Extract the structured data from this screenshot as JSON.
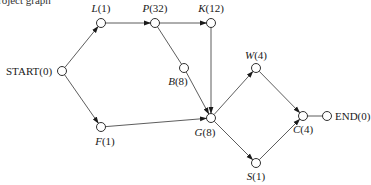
{
  "caption_fragment": "roject graph",
  "nodes": [
    {
      "id": "START",
      "name": "START",
      "weight": "(0)",
      "italic": false,
      "x": 62,
      "y": 71,
      "label_x": 6,
      "label_y": 75,
      "anchor": "start"
    },
    {
      "id": "L",
      "name": "L",
      "weight": "(1)",
      "italic": true,
      "x": 101,
      "y": 23,
      "label_x": 101,
      "label_y": 12,
      "anchor": "middle"
    },
    {
      "id": "P",
      "name": "P",
      "weight": "(32)",
      "italic": true,
      "x": 155,
      "y": 23,
      "label_x": 155,
      "label_y": 12,
      "anchor": "middle"
    },
    {
      "id": "K",
      "name": "K",
      "weight": "(12)",
      "italic": true,
      "x": 211,
      "y": 23,
      "label_x": 211,
      "label_y": 12,
      "anchor": "middle"
    },
    {
      "id": "B",
      "name": "B",
      "weight": "(8)",
      "italic": true,
      "x": 184,
      "y": 68,
      "label_x": 178,
      "label_y": 85,
      "anchor": "middle"
    },
    {
      "id": "F",
      "name": "F",
      "weight": "(1)",
      "italic": true,
      "x": 101,
      "y": 127,
      "label_x": 105,
      "label_y": 145,
      "anchor": "middle"
    },
    {
      "id": "G",
      "name": "G",
      "weight": "(8)",
      "italic": true,
      "x": 211,
      "y": 118,
      "label_x": 205,
      "label_y": 136,
      "anchor": "middle"
    },
    {
      "id": "W",
      "name": "W",
      "weight": "(4)",
      "italic": true,
      "x": 256,
      "y": 68,
      "label_x": 256,
      "label_y": 59,
      "anchor": "middle"
    },
    {
      "id": "S",
      "name": "S",
      "weight": "(1)",
      "italic": true,
      "x": 256,
      "y": 163,
      "label_x": 256,
      "label_y": 180,
      "anchor": "middle"
    },
    {
      "id": "C",
      "name": "C",
      "weight": "(4)",
      "italic": true,
      "x": 303,
      "y": 116,
      "label_x": 303,
      "label_y": 133,
      "anchor": "middle"
    },
    {
      "id": "END",
      "name": "END",
      "weight": "(0)",
      "italic": false,
      "x": 327,
      "y": 116,
      "label_x": 335,
      "label_y": 120,
      "anchor": "start"
    }
  ],
  "edges": [
    {
      "from": "START",
      "to": "L",
      "arrow": true
    },
    {
      "from": "START",
      "to": "F",
      "arrow": true
    },
    {
      "from": "L",
      "to": "P",
      "arrow": true
    },
    {
      "from": "P",
      "to": "K",
      "arrow": true
    },
    {
      "from": "P",
      "to": "B",
      "arrow": false
    },
    {
      "from": "B",
      "to": "G",
      "arrow": true
    },
    {
      "from": "K",
      "to": "G",
      "arrow": true
    },
    {
      "from": "F",
      "to": "G",
      "arrow": true
    },
    {
      "from": "G",
      "to": "W",
      "arrow": true
    },
    {
      "from": "G",
      "to": "S",
      "arrow": true
    },
    {
      "from": "W",
      "to": "C",
      "arrow": true
    },
    {
      "from": "S",
      "to": "C",
      "arrow": true
    },
    {
      "from": "C",
      "to": "END",
      "arrow": false
    }
  ],
  "style": {
    "node_radius": 4.5,
    "line_color": "#333333",
    "node_stroke": "#1a1a1a",
    "background": "#ffffff"
  }
}
